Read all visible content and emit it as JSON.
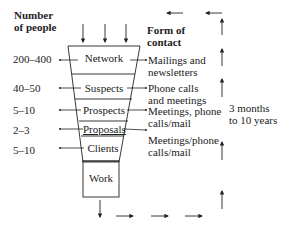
{
  "headers": {
    "left": "Number\nof people",
    "left_line1": "Number",
    "left_line2": "of people",
    "right_line1": "Form of",
    "right_line2": "contact"
  },
  "stages": [
    {
      "name": "Network",
      "count": "200–400",
      "contact_line1": "Mailings and",
      "contact_line2": "newsletters"
    },
    {
      "name": "Suspects",
      "count": "40–50",
      "contact_line1": "Phone calls",
      "contact_line2": "and meetings"
    },
    {
      "name": "Prospects",
      "count": "5–10",
      "contact_line1": "Meetings, phone",
      "contact_line2": "calls/mail"
    },
    {
      "name": "Proposals",
      "count": "2–3",
      "contact_line1": "",
      "contact_line2": ""
    },
    {
      "name": "Clients",
      "count": "5–10",
      "contact_line1": "Meetings/phone",
      "contact_line2": "calls/mail"
    },
    {
      "name": "Work",
      "count": "",
      "contact_line1": "",
      "contact_line2": ""
    }
  ],
  "duration": {
    "line1": "3 months",
    "line2": "to 10 years"
  },
  "colors": {
    "ink": "#222222",
    "background": "#ffffff"
  }
}
